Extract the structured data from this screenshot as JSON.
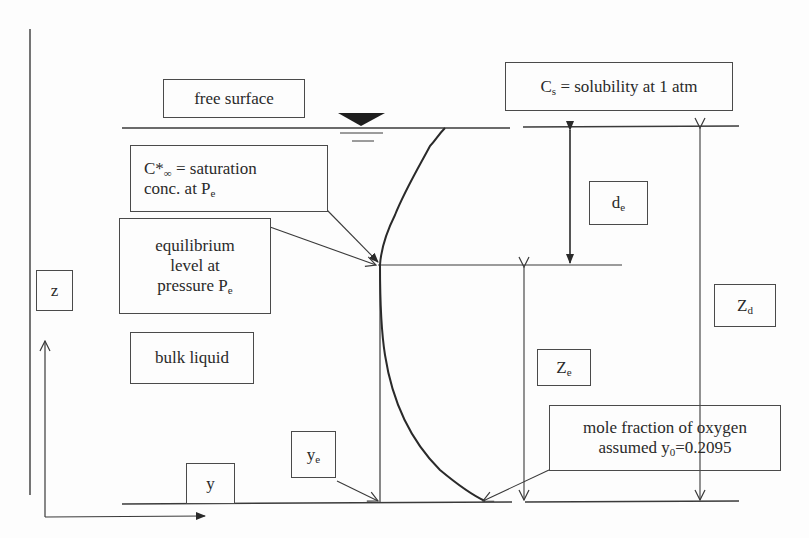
{
  "diagram": {
    "labels": {
      "free_surface": "free surface",
      "cs": {
        "main": "C",
        "sub": "s",
        "rest": " = solubility at 1 atm"
      },
      "c_star": {
        "main": "C*",
        "sub": "∞",
        "rest1": " = saturation",
        "line2": "conc. at P",
        "line2_sub": "e"
      },
      "equilibrium": {
        "line1": "equilibrium",
        "line2": "level at",
        "line3": "pressure P",
        "line3_sub": "e"
      },
      "z_axis": "z",
      "y_axis": "y",
      "bulk_liquid": "bulk liquid",
      "de": {
        "main": "d",
        "sub": "e"
      },
      "ze": {
        "main": "Z",
        "sub": "e"
      },
      "zd": {
        "main": "Z",
        "sub": "d"
      },
      "ye": {
        "main": "y",
        "sub": "e"
      },
      "mole_fraction": {
        "line1": "mole fraction of oxygen",
        "line2_pre": "assumed y",
        "line2_sub": "0",
        "line2_post": "=0.2095"
      }
    },
    "colors": {
      "line": "#3a3a3a",
      "text": "#2a2a2a",
      "background": "#fdfdfd"
    }
  }
}
